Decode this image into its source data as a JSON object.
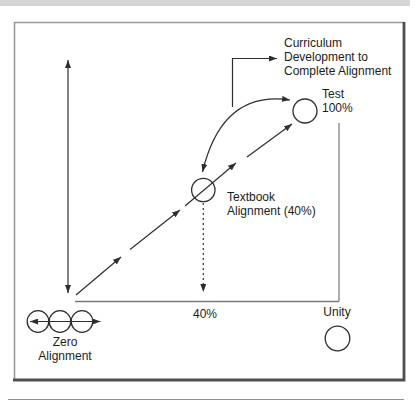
{
  "figure": {
    "annotation_curriculum": "Curriculum\nDevelopment to\nComplete Alignment",
    "test_point_label": "Test\n100%",
    "textbook_point_label": "Textbook\nAlignment (40%)",
    "x_axis_tick": "40%",
    "unity_label": "Unity",
    "zero_alignment_label": "Zero\nAlignment"
  },
  "colors": {
    "ink": "#2e2e2e",
    "axis_gray": "#7a7a7a",
    "frame_light": "#9a9a9a",
    "frame_dark": "#4f4f4f",
    "caption_bar_gray": "#d5d5d5",
    "background": "#ffffff"
  }
}
